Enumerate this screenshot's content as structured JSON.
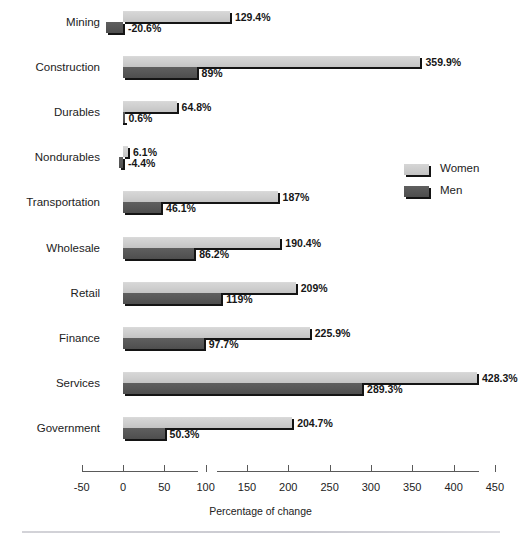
{
  "figure": {
    "faded_top_title": "",
    "axis_title": "Percentage of change",
    "legend": {
      "women_label": "Women",
      "men_label": "Men",
      "women_color": "#cfcfcf",
      "men_color": "#575757"
    }
  },
  "chart_data": {
    "type": "bar",
    "orientation": "horizontal",
    "title": "",
    "xlabel": "Percentage of change",
    "ylabel": "",
    "xlim": [
      -50,
      470
    ],
    "xticks": [
      -50,
      0,
      50,
      100,
      150,
      200,
      250,
      300,
      350,
      400,
      450
    ],
    "xtick_labels": [
      "-50",
      "0",
      "50",
      "100",
      "150",
      "200",
      "250",
      "300",
      "350",
      "400",
      "450"
    ],
    "grid": false,
    "legend_position": "right",
    "categories": [
      "Mining",
      "Construction",
      "Durables",
      "Nondurables",
      "Transportation",
      "Wholesale",
      "Retail",
      "Finance",
      "Services",
      "Government"
    ],
    "series": [
      {
        "name": "Women",
        "color": "#cfcfcf",
        "values": [
          129.4,
          359.9,
          64.8,
          6.1,
          187,
          190.4,
          209,
          225.9,
          428.3,
          204.7
        ],
        "labels": [
          "129.4%",
          "359.9%",
          "64.8%",
          "6.1%",
          "187%",
          "190.4%",
          "209%",
          "225.9%",
          "428.3%",
          "204.7%"
        ]
      },
      {
        "name": "Men",
        "color": "#575757",
        "values": [
          -20.6,
          89,
          0.6,
          -4.4,
          46.1,
          86.2,
          119,
          97.7,
          289.3,
          50.3
        ],
        "labels": [
          "-20.6%",
          "89%",
          "0.6%",
          "-4.4%",
          "46.1%",
          "86.2%",
          "119%",
          "97.7%",
          "289.3%",
          "50.3%"
        ]
      }
    ]
  }
}
